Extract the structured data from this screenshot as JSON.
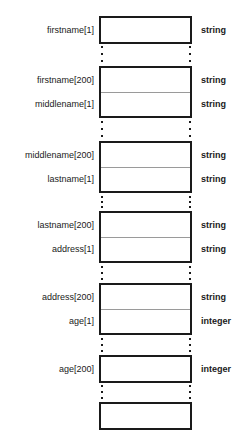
{
  "diagram": {
    "title": "",
    "kind": "memory-layout-diagram",
    "colors": {
      "background": "#ffffff",
      "block_border": "#1a1a1a",
      "cell_divider": "#9a9a9a",
      "text": "#1a1a1a"
    },
    "array_size": 200,
    "blocks": [
      {
        "id": "block-1",
        "top": 16,
        "cells": [
          {
            "label": "firstname[1]",
            "type": "string"
          }
        ]
      },
      {
        "id": "block-2",
        "top": 66,
        "cells": [
          {
            "label": "firstname[200]",
            "type": "string"
          },
          {
            "label": "middlename[1]",
            "type": "string"
          }
        ]
      },
      {
        "id": "block-3",
        "top": 141,
        "cells": [
          {
            "label": "middlename[200]",
            "type": "string"
          },
          {
            "label": "lastname[1]",
            "type": "string"
          }
        ]
      },
      {
        "id": "block-4",
        "top": 211,
        "cells": [
          {
            "label": "lastname[200]",
            "type": "string"
          },
          {
            "label": "address[1]",
            "type": "string"
          }
        ]
      },
      {
        "id": "block-5",
        "top": 283,
        "cells": [
          {
            "label": "address[200]",
            "type": "string"
          },
          {
            "label": "age[1]",
            "type": "integer"
          }
        ]
      },
      {
        "id": "block-6",
        "top": 355,
        "cells": [
          {
            "label": "age[200]",
            "type": "integer"
          }
        ]
      },
      {
        "id": "block-7",
        "top": 402,
        "cells": [
          {
            "label": "",
            "type": ""
          }
        ]
      }
    ],
    "ellipses": [
      {
        "id": "ellipsis-1",
        "top": 46,
        "height": 16
      },
      {
        "id": "ellipsis-2",
        "top": 121,
        "height": 16
      },
      {
        "id": "ellipsis-3",
        "top": 196,
        "height": 12
      },
      {
        "id": "ellipsis-4",
        "top": 266,
        "height": 14
      },
      {
        "id": "ellipsis-5",
        "top": 338,
        "height": 14
      },
      {
        "id": "ellipsis-6",
        "top": 385,
        "height": 14
      }
    ]
  }
}
